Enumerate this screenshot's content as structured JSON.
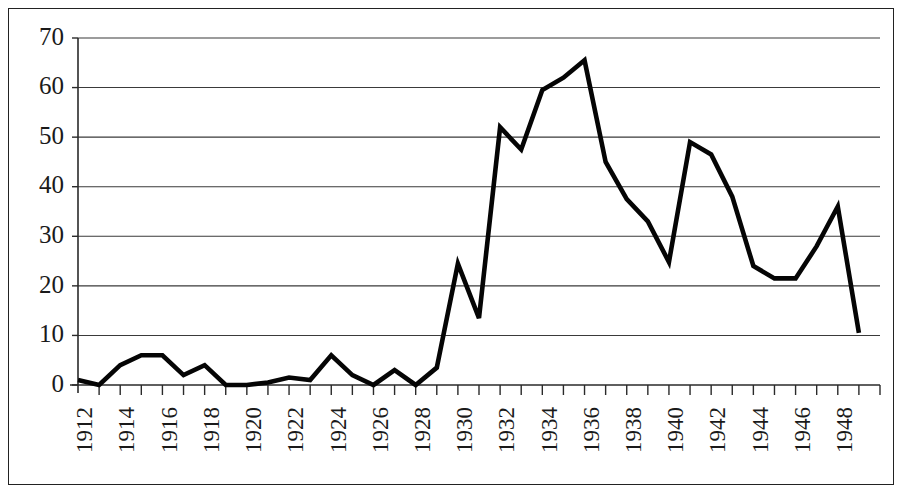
{
  "chart_data": {
    "type": "line",
    "title": "",
    "subtitle": "",
    "xlabel": "",
    "ylabel": "",
    "x": [
      1912,
      1913,
      1914,
      1915,
      1916,
      1917,
      1918,
      1919,
      1920,
      1921,
      1922,
      1923,
      1924,
      1925,
      1926,
      1927,
      1928,
      1929,
      1930,
      1931,
      1932,
      1933,
      1934,
      1935,
      1936,
      1937,
      1938,
      1939,
      1940,
      1941,
      1942,
      1943,
      1944,
      1945,
      1946,
      1947,
      1948,
      1949
    ],
    "values": [
      1,
      0,
      4,
      6,
      6,
      2,
      4,
      0,
      0,
      0.5,
      1.5,
      1,
      6,
      2,
      0,
      3,
      0,
      3.5,
      24.5,
      13.5,
      52,
      47.5,
      59.5,
      62,
      65.5,
      45,
      37.5,
      33,
      24.8,
      49,
      46.5,
      38,
      24,
      21.5,
      21.5,
      28,
      36,
      10.5
    ],
    "series": [
      {
        "name": "",
        "values": [
          1,
          0,
          4,
          6,
          6,
          2,
          4,
          0,
          0,
          0.5,
          1.5,
          1,
          6,
          2,
          0,
          3,
          0,
          3.5,
          24.5,
          13.5,
          52,
          47.5,
          59.5,
          62,
          65.5,
          45,
          37.5,
          33,
          24.8,
          49,
          46.5,
          38,
          24,
          21.5,
          21.5,
          28,
          36,
          10.5
        ]
      }
    ],
    "yticks": [
      0,
      10,
      20,
      30,
      40,
      50,
      60,
      70
    ],
    "ytick_labels": [
      "0",
      "10",
      "20",
      "30",
      "40",
      "50",
      "60",
      "70"
    ],
    "xticks": [
      1912,
      1914,
      1916,
      1918,
      1920,
      1922,
      1924,
      1926,
      1928,
      1930,
      1932,
      1934,
      1936,
      1938,
      1940,
      1942,
      1944,
      1946,
      1948
    ],
    "xtick_labels": [
      "1912",
      "1914",
      "1916",
      "1918",
      "1920",
      "1922",
      "1924",
      "1926",
      "1928",
      "1930",
      "1932",
      "1934",
      "1936",
      "1938",
      "1940",
      "1942",
      "1944",
      "1946",
      "1948"
    ],
    "xlim": [
      1912,
      1950
    ],
    "ylim": [
      0,
      70
    ],
    "grid": "horizontal",
    "legend": "none",
    "xtick_rotation": -90,
    "line_color": "#050505",
    "grid_color": "#3a3a3a",
    "axis_color": "#2a2a2a",
    "background_color": "#ffffff"
  }
}
